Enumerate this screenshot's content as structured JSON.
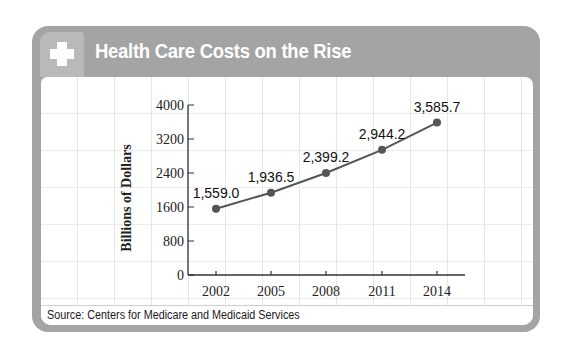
{
  "header": {
    "title": "Health Care Costs on the Rise",
    "icon": "plus-cross-icon"
  },
  "footer": {
    "source": "Source: Centers for Medicare and Medicaid Services"
  },
  "colors": {
    "frame": "#a4a4a4",
    "icon_box": "#b9b9b9",
    "line": "#555555",
    "marker": "#555555"
  },
  "chart_data": {
    "type": "line",
    "title": "Health Care Costs on the Rise",
    "xlabel": "",
    "ylabel": "Billions of Dollars",
    "categories": [
      "2002",
      "2005",
      "2008",
      "2011",
      "2014"
    ],
    "x": [
      2002,
      2005,
      2008,
      2011,
      2014
    ],
    "values": [
      1559.0,
      1936.5,
      2399.2,
      2944.2,
      3585.7
    ],
    "data_labels": [
      "1,559.0",
      "1,936.5",
      "2,399.2",
      "2,944.2",
      "3,585.7"
    ],
    "yticks": [
      "0",
      "800",
      "1600",
      "2400",
      "3200",
      "4000"
    ],
    "ylim": [
      0,
      4000
    ],
    "grid": true,
    "legend": null,
    "source": "Source: Centers for Medicare and Medicaid Services"
  }
}
